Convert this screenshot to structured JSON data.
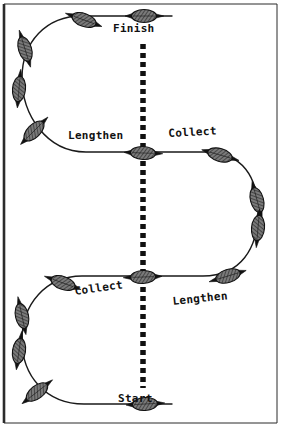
{
  "figure": {
    "type": "riding-pattern-diagram",
    "width": 282,
    "height": 428,
    "background_color": "#ffffff"
  },
  "frame": {
    "name": "figure-border",
    "stroke_color": "#2b2b2b",
    "left_stroke_width": 2.6,
    "other_stroke_width": 1.0,
    "x": 4,
    "y": 4,
    "width": 273,
    "height": 419
  },
  "centerline": {
    "name": "center-dashed-line",
    "color": "#111111",
    "width": 5.5,
    "dash_on": 5,
    "dash_off": 4,
    "x": 143,
    "y_top": 44,
    "y_bottom": 388
  },
  "path": {
    "name": "serpentine-track",
    "stroke_color": "#1a1a1a",
    "stroke_width": 1.4,
    "fill": "none",
    "d": "M 172 16 L 82 16 C 46 16 22 42 22 78 C 22 114 46 152 86 152 L 143 152 L 205 152 C 243 152 258 178 258 212 C 258 248 241 276 203 276 L 143 276 L 82 276 C 46 276 22 304 22 340 C 22 376 46 404 84 404 L 172 404"
  },
  "markers": {
    "name": "horse-rider-markers",
    "fill_color": "#6f6f6f",
    "stroke_color": "#111111",
    "hatch_color": "#1a1a1a",
    "items": [
      {
        "name": "marker-finish",
        "x": 144,
        "y": 16,
        "angle": 0,
        "length": 38,
        "width": 13
      },
      {
        "name": "marker-top-straight",
        "x": 84,
        "y": 20,
        "angle": 200,
        "length": 38,
        "width": 13
      },
      {
        "name": "marker-upper-left-1",
        "x": 25,
        "y": 49,
        "angle": 253,
        "length": 38,
        "width": 13
      },
      {
        "name": "marker-upper-left-2",
        "x": 19,
        "y": 89,
        "angle": 275,
        "length": 38,
        "width": 13
      },
      {
        "name": "marker-upper-left-3",
        "x": 34,
        "y": 131,
        "angle": 315,
        "length": 38,
        "width": 13
      },
      {
        "name": "marker-middle-center",
        "x": 143,
        "y": 153,
        "angle": 2,
        "length": 38,
        "width": 13
      },
      {
        "name": "marker-upper-right-1",
        "x": 220,
        "y": 155,
        "angle": 16,
        "length": 38,
        "width": 13
      },
      {
        "name": "marker-upper-right-2",
        "x": 257,
        "y": 200,
        "angle": 75,
        "length": 38,
        "width": 13
      },
      {
        "name": "marker-upper-right-3",
        "x": 258,
        "y": 228,
        "angle": 95,
        "length": 38,
        "width": 13
      },
      {
        "name": "marker-lower-right-1",
        "x": 228,
        "y": 276,
        "angle": 163,
        "length": 38,
        "width": 13
      },
      {
        "name": "marker-lower-center",
        "x": 143,
        "y": 277,
        "angle": 178,
        "length": 38,
        "width": 13
      },
      {
        "name": "marker-lower-left-1",
        "x": 63,
        "y": 283,
        "angle": 200,
        "length": 38,
        "width": 13
      },
      {
        "name": "marker-lower-left-2",
        "x": 22,
        "y": 316,
        "angle": 258,
        "length": 38,
        "width": 13
      },
      {
        "name": "marker-lower-left-3",
        "x": 19,
        "y": 351,
        "angle": 278,
        "length": 38,
        "width": 13
      },
      {
        "name": "marker-lower-left-4",
        "x": 37,
        "y": 392,
        "angle": 322,
        "length": 38,
        "width": 13
      },
      {
        "name": "marker-start",
        "x": 145,
        "y": 404,
        "angle": 357,
        "length": 38,
        "width": 13
      }
    ]
  },
  "labels": [
    {
      "name": "label-finish",
      "text": "Finish",
      "x": 113,
      "y": 23,
      "rotate": 0
    },
    {
      "name": "label-lengthen-upper",
      "text": "Lengthen",
      "x": 68,
      "y": 130,
      "rotate": 0
    },
    {
      "name": "label-collect-upper",
      "text": "Collect",
      "x": 168,
      "y": 128,
      "rotate": -3
    },
    {
      "name": "label-collect-lower",
      "text": "Collect",
      "x": 74,
      "y": 286,
      "rotate": -8
    },
    {
      "name": "label-lengthen-lower",
      "text": "Lengthen",
      "x": 172,
      "y": 296,
      "rotate": -6
    },
    {
      "name": "label-start",
      "text": "Start",
      "x": 118,
      "y": 393,
      "rotate": 0
    }
  ]
}
